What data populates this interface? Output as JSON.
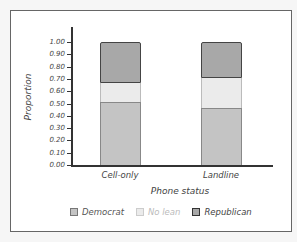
{
  "chart_data": {
    "type": "bar",
    "stacked": true,
    "title": "",
    "xlabel": "Phone status",
    "ylabel": "Proportion",
    "ylim": [
      0,
      1
    ],
    "yticks": [
      "0.00",
      "0.10",
      "0.20",
      "0.30",
      "0.40",
      "0.50",
      "0.60",
      "0.70",
      "0.80",
      "0.90",
      "1.00"
    ],
    "categories": [
      "Cell-only",
      "Landline"
    ],
    "series": [
      {
        "name": "Democrat",
        "values": [
          0.51,
          0.46
        ],
        "color": "#c4c4c4"
      },
      {
        "name": "No lean",
        "values": [
          0.16,
          0.25
        ],
        "color": "#ebebeb"
      },
      {
        "name": "Republican",
        "values": [
          0.33,
          0.29
        ],
        "color": "#a8a8a8"
      }
    ],
    "grid": false,
    "legend_position": "bottom"
  },
  "legend": {
    "items": [
      {
        "label": "Democrat",
        "color": "#c4c4c4",
        "text_color": "#555"
      },
      {
        "label": "No lean",
        "color": "#ebebeb",
        "text_color": "#bbb"
      },
      {
        "label": "Republican",
        "color": "#a8a8a8",
        "text_color": "#444"
      }
    ]
  }
}
